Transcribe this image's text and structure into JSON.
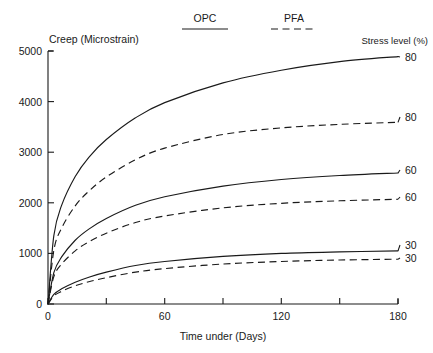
{
  "chart_data": {
    "type": "line",
    "title": "",
    "xlabel": "Time under (Days)",
    "ylabel": "Creep (Microstrain)",
    "right_axis_title": "Stress level (%)",
    "xlim": [
      0,
      180
    ],
    "ylim": [
      0,
      5000
    ],
    "xticks": [
      0,
      30,
      60,
      90,
      120,
      150,
      180
    ],
    "xticklabels": [
      "0",
      "",
      "60",
      "",
      "120",
      "",
      "180"
    ],
    "yticks": [
      0,
      1000,
      2000,
      3000,
      4000,
      5000
    ],
    "yticklabels": [
      "0",
      "1000",
      "2000",
      "3000",
      "4000",
      "5000"
    ],
    "grid": false,
    "legend_position": "top-center",
    "legend": [
      {
        "name": "OPC",
        "style": "solid"
      },
      {
        "name": "PFA",
        "style": "dashed"
      }
    ],
    "x": [
      0,
      3,
      7,
      14,
      21,
      30,
      45,
      60,
      90,
      120,
      150,
      180
    ],
    "series": [
      {
        "name": "OPC 80",
        "mix": "OPC",
        "stress_level": 80,
        "style": "solid",
        "end_label": "80",
        "values": [
          0,
          1350,
          1950,
          2520,
          2900,
          3250,
          3680,
          3980,
          4370,
          4620,
          4790,
          4890
        ]
      },
      {
        "name": "PFA 80",
        "mix": "PFA",
        "stress_level": 80,
        "style": "dashed",
        "end_label": "80",
        "values": [
          0,
          1060,
          1500,
          1940,
          2230,
          2510,
          2850,
          3080,
          3350,
          3480,
          3550,
          3590
        ]
      },
      {
        "name": "OPC 60",
        "mix": "OPC",
        "stress_level": 60,
        "style": "solid",
        "end_label": "60",
        "values": [
          0,
          620,
          930,
          1260,
          1480,
          1690,
          1950,
          2120,
          2330,
          2460,
          2540,
          2590
        ]
      },
      {
        "name": "PFA 60",
        "mix": "PFA",
        "stress_level": 60,
        "style": "dashed",
        "end_label": "60",
        "values": [
          0,
          540,
          790,
          1050,
          1230,
          1400,
          1610,
          1740,
          1900,
          1990,
          2040,
          2070
        ]
      },
      {
        "name": "OPC 30",
        "mix": "OPC",
        "stress_level": 30,
        "style": "solid",
        "end_label": "30",
        "values": [
          0,
          190,
          300,
          430,
          530,
          630,
          760,
          840,
          940,
          1000,
          1030,
          1050
        ]
      },
      {
        "name": "PFA 30",
        "mix": "PFA",
        "stress_level": 30,
        "style": "dashed",
        "end_label": "30",
        "values": [
          0,
          160,
          250,
          360,
          440,
          520,
          630,
          700,
          790,
          840,
          870,
          885
        ]
      }
    ]
  },
  "labels": {
    "y_axis_title": "Creep (Microstrain)",
    "x_axis_title": "Time under (Days)",
    "right_title": "Stress level (%)",
    "legend_opc": "OPC",
    "legend_pfa": "PFA",
    "yt0": "0",
    "yt1": "1000",
    "yt2": "2000",
    "yt3": "3000",
    "yt4": "4000",
    "yt5": "5000",
    "xt0": "0",
    "xt60": "60",
    "xt120": "120",
    "xt180": "180",
    "end_opc80": "80",
    "end_pfa80": "80",
    "end_opc60": "60",
    "end_pfa60": "60",
    "end_opc30": "30",
    "end_pfa30": "30"
  },
  "colors": {
    "ink": "#1a1a1a",
    "background": "#ffffff"
  }
}
